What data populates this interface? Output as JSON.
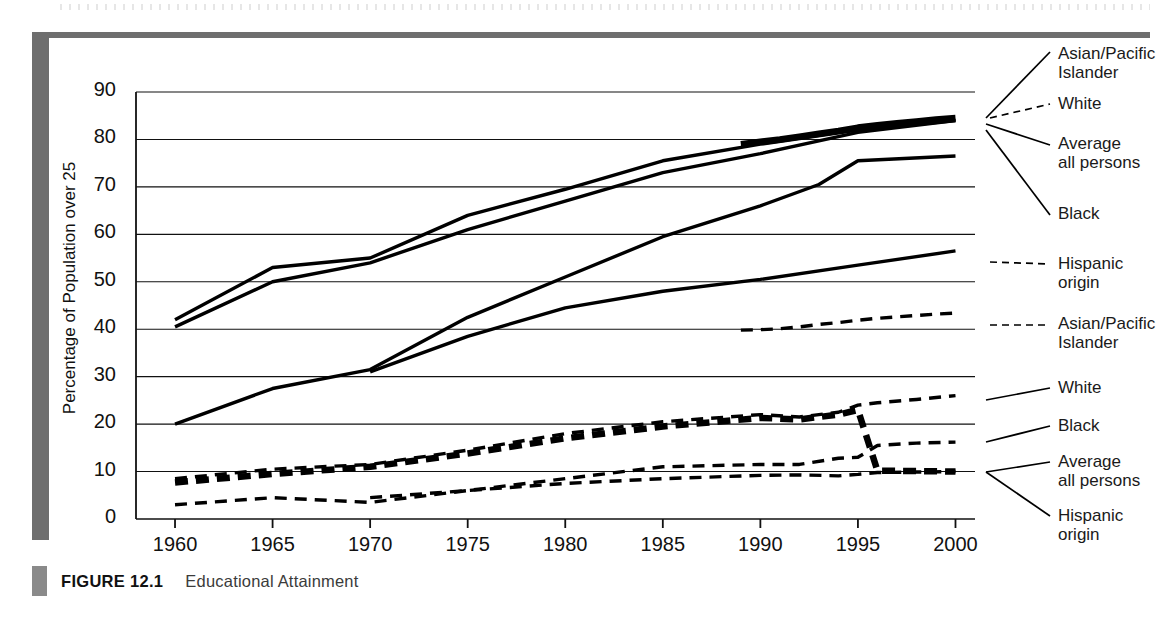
{
  "figure": {
    "label": "FIGURE 12.1",
    "title": "Educational Attainment"
  },
  "colors": {
    "ink": "#000000",
    "frame": "#6e6e6e",
    "caption_text": "#3b3b3b"
  },
  "chart_data": {
    "type": "line",
    "title": "Educational Attainment",
    "xlabel": "",
    "ylabel": "Percentage of Population over 25",
    "xlim": [
      1958,
      2001
    ],
    "ylim": [
      0,
      90
    ],
    "grid": true,
    "legend_position": "right",
    "x_ticks": [
      "1960",
      "1965",
      "1970",
      "1975",
      "1980",
      "1985",
      "1990",
      "1995",
      "2000"
    ],
    "y_ticks": [
      "0",
      "10",
      "20",
      "30",
      "40",
      "50",
      "60",
      "70",
      "80",
      "90"
    ],
    "annotations": [
      "Solid lines = High school completion",
      "Dashed lines = College completion"
    ],
    "series": [
      {
        "name": "Asian/Pacific Islander",
        "group": "high-school",
        "style": "solid",
        "width": "thick",
        "legend_label_line1": "Asian/Pacific",
        "legend_label_line2": "Islander",
        "x": [
          1989,
          1990,
          1991,
          1992,
          1993,
          1994,
          1995,
          1996,
          1997,
          1998,
          1999,
          2000
        ],
        "y": [
          79.0,
          79.5,
          80.0,
          80.6,
          81.2,
          81.8,
          82.5,
          83.0,
          83.4,
          83.8,
          84.2,
          84.5
        ]
      },
      {
        "name": "White",
        "group": "high-school",
        "style": "solid",
        "width": "medium",
        "legend_label_line1": "White",
        "legend_label_line2": "",
        "x": [
          1960,
          1965,
          1970,
          1975,
          1980,
          1985,
          1990,
          1995,
          2000
        ],
        "y": [
          42.0,
          53.0,
          55.0,
          64.0,
          69.5,
          75.5,
          79.0,
          82.0,
          84.0
        ]
      },
      {
        "name": "Average all persons",
        "group": "high-school",
        "style": "solid",
        "width": "medium",
        "legend_label_line1": "Average",
        "legend_label_line2": "all persons",
        "x": [
          1960,
          1965,
          1970,
          1975,
          1980,
          1985,
          1990,
          1995,
          2000
        ],
        "y": [
          40.5,
          50.0,
          54.0,
          61.0,
          67.0,
          73.0,
          77.0,
          81.5,
          84.0
        ]
      },
      {
        "name": "Black",
        "group": "high-school",
        "style": "solid",
        "width": "medium",
        "legend_label_line1": "Black",
        "legend_label_line2": "",
        "x": [
          1960,
          1965,
          1970,
          1975,
          1980,
          1985,
          1990,
          1993,
          1995,
          2000
        ],
        "y": [
          20.0,
          27.5,
          31.5,
          42.5,
          51.0,
          59.5,
          66.0,
          70.5,
          75.5,
          76.5
        ]
      },
      {
        "name": "Hispanic origin",
        "group": "high-school",
        "style": "solid",
        "width": "medium",
        "legend_label_line1": "Hispanic",
        "legend_label_line2": "origin",
        "x": [
          1970,
          1975,
          1980,
          1985,
          1990,
          1995,
          2000
        ],
        "y": [
          31.0,
          38.5,
          44.5,
          48.0,
          50.5,
          53.5,
          56.5
        ]
      },
      {
        "name": "Asian/Pacific Islander",
        "group": "college",
        "style": "dashed",
        "width": "medium",
        "legend_label_line1": "Asian/Pacific",
        "legend_label_line2": "Islander",
        "x": [
          1989,
          1990,
          1991,
          1992,
          1993,
          1994,
          1995,
          1996,
          1997,
          1998,
          1999,
          2000
        ],
        "y": [
          39.8,
          39.9,
          40.1,
          40.5,
          41.0,
          41.4,
          41.9,
          42.3,
          42.6,
          42.9,
          43.2,
          43.4
        ]
      },
      {
        "name": "White",
        "group": "college",
        "style": "dashed",
        "width": "medium",
        "legend_label_line1": "White",
        "legend_label_line2": "",
        "x": [
          1960,
          1965,
          1970,
          1975,
          1980,
          1985,
          1990,
          1992,
          1994,
          1995,
          1996,
          1998,
          2000
        ],
        "y": [
          8.5,
          10.5,
          11.5,
          14.5,
          18.0,
          20.5,
          22.0,
          21.5,
          22.5,
          24.0,
          24.5,
          25.2,
          26.0
        ]
      },
      {
        "name": "Black",
        "group": "college",
        "style": "dashed",
        "width": "medium",
        "legend_label_line1": "Black",
        "legend_label_line2": "",
        "x": [
          1960,
          1965,
          1970,
          1975,
          1980,
          1985,
          1990,
          1992,
          1994,
          1995,
          1996,
          1998,
          2000
        ],
        "y": [
          3.0,
          4.5,
          3.5,
          6.0,
          8.5,
          11.0,
          11.5,
          11.5,
          12.8,
          13.0,
          15.5,
          16.0,
          16.2
        ]
      },
      {
        "name": "Average all persons",
        "group": "college",
        "style": "dashed",
        "width": "thick",
        "legend_label_line1": "Average",
        "legend_label_line2": "all persons",
        "x": [
          1960,
          1965,
          1970,
          1975,
          1980,
          1985,
          1990,
          1992,
          1994,
          1995,
          1996,
          1998,
          2000
        ],
        "y": [
          7.7,
          9.5,
          11.0,
          13.8,
          17.0,
          19.5,
          21.3,
          21.0,
          22.0,
          23.0,
          10.2,
          10.1,
          10.0
        ]
      },
      {
        "name": "Hispanic origin",
        "group": "college",
        "style": "dashed",
        "width": "medium",
        "legend_label_line1": "Hispanic",
        "legend_label_line2": "origin",
        "x": [
          1970,
          1975,
          1980,
          1985,
          1990,
          1992,
          1994,
          1995,
          1996,
          1998,
          2000
        ],
        "y": [
          4.5,
          6.0,
          7.5,
          8.5,
          9.2,
          9.3,
          9.1,
          9.4,
          9.8,
          9.9,
          10.0
        ]
      }
    ],
    "legend_right": [
      {
        "line1": "Asian/Pacific",
        "line2": "Islander",
        "top": 44
      },
      {
        "line1": "White",
        "line2": "",
        "top": 94
      },
      {
        "line1": "Average",
        "line2": "all persons",
        "top": 134
      },
      {
        "line1": "Black",
        "line2": "",
        "top": 204
      },
      {
        "line1": "Hispanic",
        "line2": "origin",
        "top": 254
      },
      {
        "line1": "Asian/Pacific",
        "line2": "Islander",
        "top": 314
      },
      {
        "line1": "White",
        "line2": "",
        "top": 378
      },
      {
        "line1": "Black",
        "line2": "",
        "top": 416
      },
      {
        "line1": "Average",
        "line2": "all persons",
        "top": 452
      },
      {
        "line1": "Hispanic",
        "line2": "origin",
        "top": 506
      }
    ]
  }
}
